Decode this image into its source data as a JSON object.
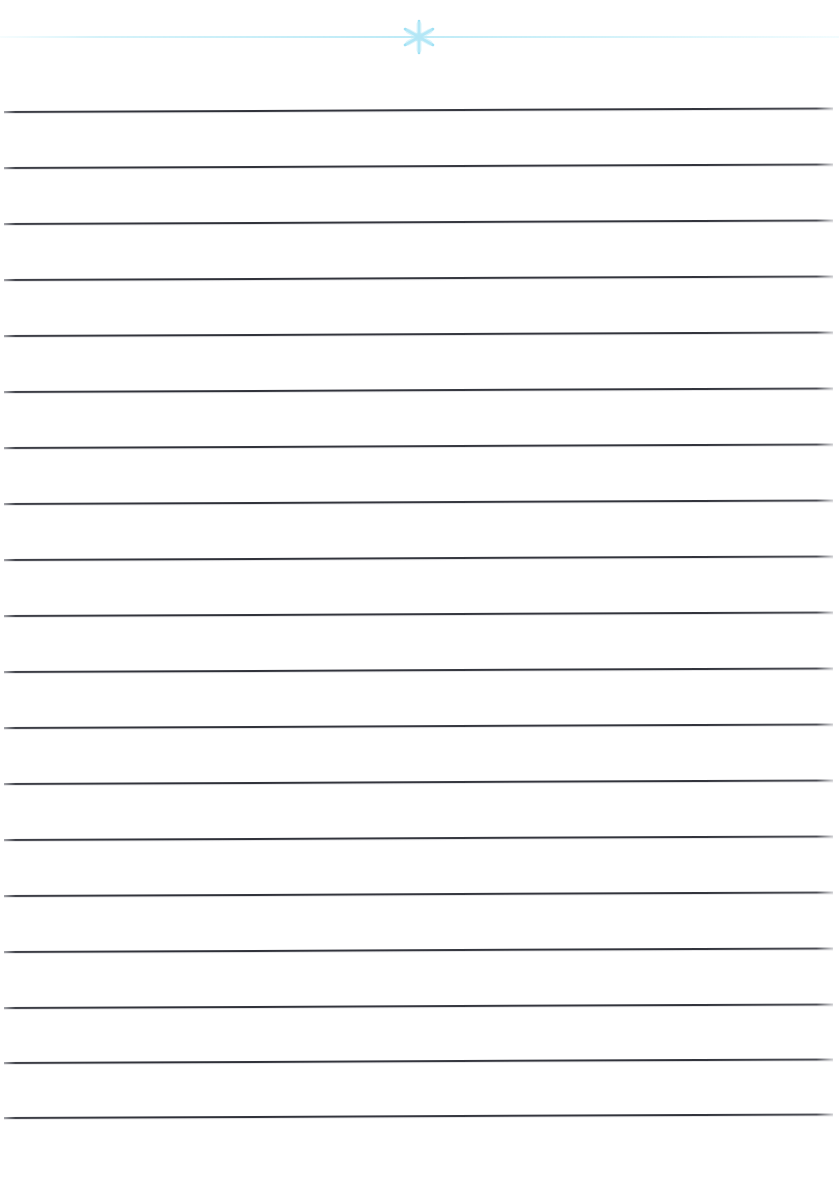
{
  "document": {
    "kind": "lined-paper-sheet",
    "title": "Blank Lined Writing Sheet",
    "page_width": 839,
    "page_height": 1180,
    "background_color": "#ffffff",
    "body_text": "",
    "has_text_content": false
  },
  "header": {
    "rule": {
      "label": "header rule",
      "color": "#b2e8f5",
      "y": 37,
      "x_start": 0,
      "x_end": 839,
      "thickness": 2
    },
    "ornament": {
      "name": "star-asterisk",
      "glyph": "✳",
      "label": "snowflake star ornament",
      "color": "#aae4f5",
      "center_x": 419,
      "center_y": 37,
      "points": 6,
      "size": 42
    }
  },
  "ruled_lines": {
    "label": "writing rules",
    "count": 19,
    "color": "#33353d",
    "thickness": 1.6,
    "spacing": 56,
    "first_y": 112,
    "last_y": 1118,
    "x_start": 4,
    "x_end": 833,
    "tilt_degrees": -0.25,
    "y_positions": [
      112,
      168,
      224,
      280,
      336,
      392,
      448,
      504,
      560,
      616,
      672,
      728,
      784,
      840,
      896,
      952,
      1008,
      1063,
      1118
    ]
  },
  "margins": {
    "top_blank_height": 112,
    "bottom_blank_height": 62,
    "left_blank_width": 4,
    "right_blank_width": 6
  }
}
